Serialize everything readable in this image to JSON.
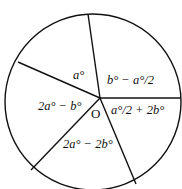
{
  "diagram": {
    "type": "circle-sectors",
    "center_label": "O",
    "stroke_color": "#111111",
    "background": "#ffffff",
    "sectors": [
      {
        "label": "a°"
      },
      {
        "label": "b° − a°/2"
      },
      {
        "label": "a°/2 + 2b°"
      },
      {
        "label": "2a° − 2b°"
      },
      {
        "label": "2a° − b°"
      }
    ]
  }
}
